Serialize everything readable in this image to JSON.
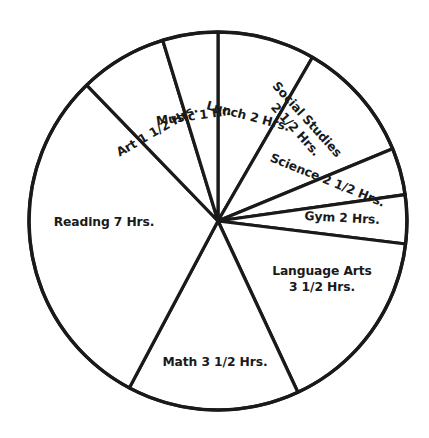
{
  "chart_data": {
    "type": "pie",
    "title": "",
    "subtitle": "",
    "xlabel": "",
    "ylabel": "",
    "unit": "Hrs.",
    "total_hours": 24,
    "legend_position": "none",
    "grid": false,
    "style": {
      "fill": "#ffffff",
      "stroke": "#1a1a1a",
      "background": "#ffffff",
      "text_color": "#1a1a1a"
    },
    "geometry": {
      "center_x": 218,
      "center_y": 221,
      "radius": 189,
      "start_angle_deg": 0,
      "direction": "clockwise"
    },
    "categories": [
      "Lunch",
      "Social Studies",
      "Science",
      "Gym",
      "Language Arts",
      "Math",
      "Reading",
      "Art",
      "Music"
    ],
    "values": [
      2,
      2.5,
      2.5,
      2,
      3.5,
      3.5,
      7,
      1.5,
      1
    ],
    "slices": [
      {
        "name": "lunch",
        "label": "Lunch 2 Hrs.",
        "value": 2,
        "start_deg": 0,
        "end_deg": 30,
        "label_lines": [
          "Lunch 2 Hrs."
        ],
        "label_x": 247,
        "label_y": 120,
        "label_rotation": 15,
        "label_anchor": "middle"
      },
      {
        "name": "social-studies",
        "label": "Social Studies 2 1/2 Hrs.",
        "value": 2.5,
        "start_deg": 30,
        "end_deg": 67.5,
        "label_lines": [
          "Social Studies",
          "2 1/2 Hrs."
        ],
        "label_x": 304,
        "label_y": 122,
        "label_rotation": 48,
        "label_anchor": "middle"
      },
      {
        "name": "science",
        "label": "Science 2 1/2 Hrs.",
        "value": 2.5,
        "start_deg": 67.5,
        "end_deg": 82,
        "label_lines": [
          "Science 2 1/2 Hrs."
        ],
        "label_x": 326,
        "label_y": 184,
        "label_rotation": 22,
        "label_anchor": "middle"
      },
      {
        "name": "gym",
        "label": "Gym 2 Hrs.",
        "value": 2,
        "start_deg": 82,
        "end_deg": 97,
        "label_lines": [
          "Gym 2 Hrs."
        ],
        "label_x": 342,
        "label_y": 222,
        "label_rotation": 3,
        "label_anchor": "middle"
      },
      {
        "name": "language-arts",
        "label": "Language Arts 3 1/2 Hrs.",
        "value": 3.5,
        "start_deg": 97,
        "end_deg": 155,
        "label_lines": [
          "Language Arts",
          "3 1/2 Hrs."
        ],
        "label_x": 322,
        "label_y": 275,
        "label_rotation": 0,
        "label_anchor": "middle"
      },
      {
        "name": "math",
        "label": "Math 3 1/2 Hrs.",
        "value": 3.5,
        "start_deg": 155,
        "end_deg": 208,
        "label_lines": [
          "Math 3 1/2 Hrs."
        ],
        "label_x": 215,
        "label_y": 366,
        "label_rotation": 0,
        "label_anchor": "middle"
      },
      {
        "name": "reading",
        "label": "Reading 7 Hrs.",
        "value": 7,
        "start_deg": 208,
        "end_deg": 316,
        "label_lines": [
          "Reading 7 Hrs."
        ],
        "label_x": 104,
        "label_y": 226,
        "label_rotation": 0,
        "label_anchor": "middle"
      },
      {
        "name": "art",
        "label": "Art 1 1/2 Hrs.",
        "value": 1.5,
        "start_deg": 316,
        "end_deg": 343,
        "label_lines": [
          "Art 1 1/2 Hrs."
        ],
        "label_x": 159,
        "label_y": 134,
        "label_rotation": -30,
        "label_anchor": "middle"
      },
      {
        "name": "music",
        "label": "Music 1 Hr.",
        "value": 1,
        "start_deg": 343,
        "end_deg": 360,
        "label_lines": [
          "Music 1 Hr."
        ],
        "label_x": 194,
        "label_y": 120,
        "label_rotation": -8,
        "label_anchor": "middle"
      }
    ]
  }
}
